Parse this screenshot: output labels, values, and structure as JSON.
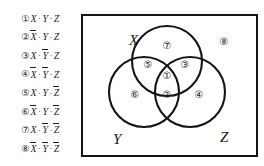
{
  "terms": [
    {
      "num": "①",
      "index": 1,
      "literals": [
        {
          "var": "X",
          "neg": false
        },
        {
          "var": "Y",
          "neg": false
        },
        {
          "var": "Z",
          "neg": false
        }
      ],
      "text": "X·Y·Z"
    },
    {
      "num": "②",
      "index": 2,
      "literals": [
        {
          "var": "X",
          "neg": true
        },
        {
          "var": "Y",
          "neg": false
        },
        {
          "var": "Z",
          "neg": false
        }
      ],
      "text": "X̄·Y·Z"
    },
    {
      "num": "③",
      "index": 3,
      "literals": [
        {
          "var": "X",
          "neg": false
        },
        {
          "var": "Y",
          "neg": true
        },
        {
          "var": "Z",
          "neg": false
        }
      ],
      "text": "X·Ȳ·Z"
    },
    {
      "num": "④",
      "index": 4,
      "literals": [
        {
          "var": "X",
          "neg": true
        },
        {
          "var": "Y",
          "neg": true
        },
        {
          "var": "Z",
          "neg": false
        }
      ],
      "text": "X̄·Ȳ·Z"
    },
    {
      "num": "⑤",
      "index": 5,
      "literals": [
        {
          "var": "X",
          "neg": false
        },
        {
          "var": "Y",
          "neg": false
        },
        {
          "var": "Z",
          "neg": true
        }
      ],
      "text": "X·Y·Z̄"
    },
    {
      "num": "⑥",
      "index": 6,
      "literals": [
        {
          "var": "X",
          "neg": true
        },
        {
          "var": "Y",
          "neg": false
        },
        {
          "var": "Z",
          "neg": true
        }
      ],
      "text": "X̄·Y·Z̄"
    },
    {
      "num": "⑦",
      "index": 7,
      "literals": [
        {
          "var": "X",
          "neg": false
        },
        {
          "var": "Y",
          "neg": true
        },
        {
          "var": "Z",
          "neg": true
        }
      ],
      "text": "X·Ȳ·Z̄"
    },
    {
      "num": "⑧",
      "index": 8,
      "literals": [
        {
          "var": "X",
          "neg": true
        },
        {
          "var": "Y",
          "neg": true
        },
        {
          "var": "Z",
          "neg": true
        }
      ],
      "text": "X̄·Ȳ·Z̄"
    }
  ],
  "separator": "·",
  "venn": {
    "set_labels": [
      {
        "name": "X",
        "text": "X",
        "x": 46,
        "y": 17
      },
      {
        "name": "Y",
        "text": "Y",
        "x": 30,
        "y": 116
      },
      {
        "name": "Z",
        "text": "Z",
        "x": 137,
        "y": 114
      }
    ],
    "regions": [
      {
        "num": "①",
        "index": 1,
        "name": "x-and-y-and-z",
        "x": 84,
        "y": 60
      },
      {
        "num": "②",
        "index": 2,
        "name": "y-and-z-not-x",
        "x": 84,
        "y": 79
      },
      {
        "num": "③",
        "index": 3,
        "name": "x-and-z-not-y",
        "x": 102,
        "y": 49
      },
      {
        "num": "④",
        "index": 4,
        "name": "z-only",
        "x": 116,
        "y": 79
      },
      {
        "num": "⑤",
        "index": 5,
        "name": "x-and-y-not-z",
        "x": 65,
        "y": 49
      },
      {
        "num": "⑥",
        "index": 6,
        "name": "y-only",
        "x": 52,
        "y": 79
      },
      {
        "num": "⑦",
        "index": 7,
        "name": "x-only",
        "x": 84,
        "y": 30
      },
      {
        "num": "⑧",
        "index": 8,
        "name": "outside-all",
        "x": 141,
        "y": 26
      }
    ],
    "circles": [
      {
        "name": "X",
        "cx": 84,
        "cy": 45,
        "r": 35
      },
      {
        "name": "Y",
        "cx": 61,
        "cy": 76,
        "r": 35
      },
      {
        "name": "Z",
        "cx": 107,
        "cy": 76,
        "r": 35
      }
    ],
    "colors": {
      "stroke": "#141414",
      "border": "#141414",
      "background": "#ffffff"
    }
  }
}
